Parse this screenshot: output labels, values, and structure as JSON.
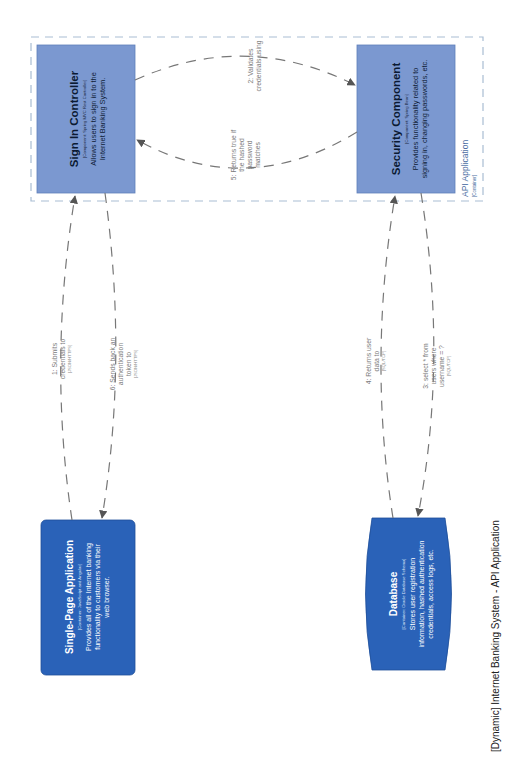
{
  "diagram": {
    "title": "[Dynamic] Internet Banking System - API Application",
    "boundary": {
      "label": "API Application",
      "type": "[Container]",
      "border_color": "#9fb6cf"
    },
    "nodes": {
      "sign_in_controller": {
        "name": "Sign In Controller",
        "technology": "[Component: Spring MVC Rest Controller]",
        "description_lines": [
          "Allows users to sign in to the",
          "Internet Banking System."
        ],
        "fill": "#7b98d0"
      },
      "security_component": {
        "name": "Security Component",
        "technology": "[Component: Spring Bean]",
        "description_lines": [
          "Provides functionality related to",
          "signing in, changing passwords, etc."
        ],
        "fill": "#7b98d0"
      },
      "single_page_application": {
        "name": "Single-Page Application",
        "technology": "[Container: JavaScript and Angular]",
        "description_lines": [
          "Provides all of the Internet banking",
          "functionality to customers via their",
          "web browser."
        ],
        "fill": "#2a62b8"
      },
      "database": {
        "name": "Database",
        "technology": "[Container: Oracle Database Schema]",
        "description_lines": [
          "Stores user registration",
          "information, hashed authentication",
          "credentials, access logs, etc."
        ],
        "fill": "#2a62b8"
      }
    },
    "relationships": [
      {
        "step": "1",
        "lines": [
          "1: Submits",
          "credentials to"
        ],
        "technology": "[JSON/HTTPS]"
      },
      {
        "step": "2",
        "lines": [
          "2: Validates",
          "credentials using"
        ],
        "technology": ""
      },
      {
        "step": "3",
        "lines": [
          "3: select * from",
          "users where",
          "username = ?"
        ],
        "technology": "[SQL/TCP]"
      },
      {
        "step": "4",
        "lines": [
          "4: Returns user",
          "data to"
        ],
        "technology": "[SQL/TCP]"
      },
      {
        "step": "5",
        "lines": [
          "5: Returns true if",
          "the hashed",
          "password",
          "matches"
        ],
        "technology": ""
      },
      {
        "step": "6",
        "lines": [
          "6: Sends back an",
          "authentication",
          "token to"
        ],
        "technology": "[JSON/HTTPS]"
      }
    ]
  }
}
